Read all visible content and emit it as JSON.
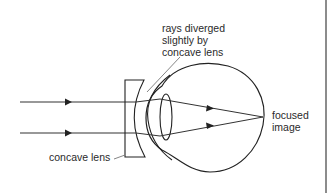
{
  "diagram": {
    "labels": {
      "rays_diverged_line1": "rays diverged",
      "rays_diverged_line2": "slightly by",
      "rays_diverged_line3": "concave lens",
      "focused_image_line1": "focused",
      "focused_image_line2": "image",
      "concave_lens": "concave lens"
    },
    "components": [
      "incoming parallel rays",
      "concave lens",
      "cornea",
      "eye lens",
      "eyeball",
      "focus point on retina"
    ],
    "colors": {
      "stroke": "#222222",
      "pointer": "#777777",
      "text": "#2a2a2a",
      "edge": "#8c8c8c"
    }
  }
}
